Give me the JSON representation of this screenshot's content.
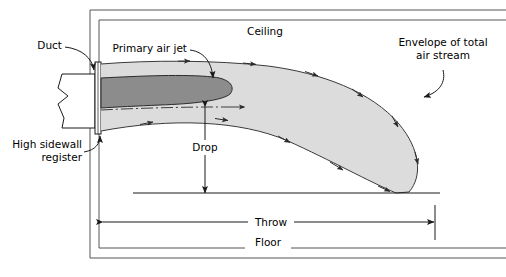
{
  "figure": {
    "type": "technical-line-diagram"
  },
  "labels": {
    "duct": "Duct",
    "primary_air_jet": "Primary air jet",
    "ceiling": "Ceiling",
    "envelope_line1": "Envelope of total",
    "envelope_line2": "air stream",
    "high_sidewall_line1": "High sidewall",
    "high_sidewall_line2": "register",
    "drop": "Drop",
    "throw": "Throw",
    "floor": "Floor"
  },
  "colors": {
    "line": "#1a1a1a",
    "envelope_fill": "#dcdcdc",
    "envelope_stroke": "#3a3a3a",
    "primary_jet_fill": "#8c8c8c",
    "primary_jet_stroke": "#2b2b2b",
    "room_wall": "#555555",
    "background": "#ffffff"
  },
  "elements": {
    "room_outline": "double-line room section: ceiling top, left sidewall, floor bottom",
    "duct_symbol": "rectangular duct with break (zigzag) symbol",
    "register": "narrow vertical rectangle at sidewall outlet",
    "centerline": "dash-dot jet centerline",
    "drop_dimension": "vertical double-headed arrow from centerline to lower level",
    "throw_dimension": "horizontal double-headed arrow from register face to stream terminus",
    "flow_arrows": "arrowheads along upper and lower envelope boundaries indicating air flow direction"
  }
}
